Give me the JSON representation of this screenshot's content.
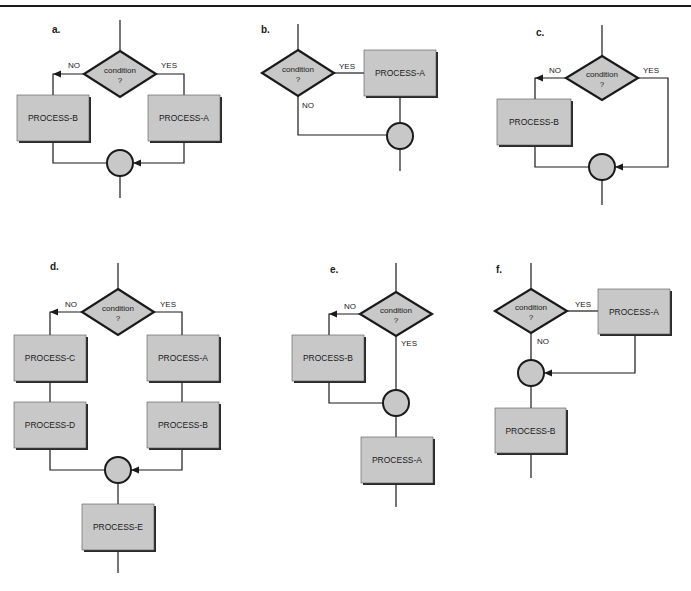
{
  "colors": {
    "fill": "#c8c8c8",
    "stroke": "#1a1a1a",
    "shadow": "#2a2a2a",
    "background": "#ffffff"
  },
  "labels": {
    "condition_line1": "condition",
    "condition_line2": "?",
    "yes": "YES",
    "no": "NO"
  },
  "panels": [
    {
      "id": "a",
      "label": "a.",
      "label_pos": [
        52,
        33
      ],
      "decision": {
        "cx": 120,
        "cy": 74,
        "hw": 36,
        "hh": 23
      },
      "boxes": [
        {
          "text": "PROCESS-B",
          "x": 17,
          "y": 95,
          "w": 72,
          "h": 46
        },
        {
          "text": "PROCESS-A",
          "x": 148,
          "y": 95,
          "w": 72,
          "h": 46
        }
      ],
      "junctions": [
        {
          "cx": 120,
          "cy": 163,
          "r": 13
        }
      ],
      "lines": [
        [
          [
            120,
            20
          ],
          [
            120,
            51
          ]
        ],
        [
          [
            84,
            74
          ],
          [
            53,
            74
          ],
          [
            53,
            95
          ]
        ],
        [
          [
            156,
            74
          ],
          [
            184,
            74
          ],
          [
            184,
            95
          ]
        ],
        [
          [
            53,
            141
          ],
          [
            53,
            163
          ],
          [
            107,
            163
          ]
        ],
        [
          [
            184,
            141
          ],
          [
            184,
            163
          ],
          [
            133,
            163
          ]
        ],
        [
          [
            120,
            176
          ],
          [
            120,
            198
          ]
        ]
      ],
      "arrows": [
        {
          "x": 53,
          "y": 74,
          "dir": "left"
        },
        {
          "x": 133,
          "y": 163,
          "dir": "left"
        }
      ],
      "texts": [
        {
          "key": "no",
          "x": 68,
          "y": 68
        },
        {
          "key": "yes",
          "x": 161,
          "y": 68
        }
      ]
    },
    {
      "id": "b",
      "label": "b.",
      "label_pos": [
        261,
        33
      ],
      "decision": {
        "cx": 298,
        "cy": 73,
        "hw": 36,
        "hh": 23
      },
      "boxes": [
        {
          "text": "PROCESS-A",
          "x": 364,
          "y": 50,
          "w": 72,
          "h": 46
        }
      ],
      "junctions": [
        {
          "cx": 400,
          "cy": 136,
          "r": 13
        }
      ],
      "lines": [
        [
          [
            298,
            24
          ],
          [
            298,
            50
          ]
        ],
        [
          [
            334,
            73
          ],
          [
            364,
            73
          ]
        ],
        [
          [
            298,
            96
          ],
          [
            298,
            135
          ],
          [
            387,
            135
          ]
        ],
        [
          [
            400,
            96
          ],
          [
            400,
            123
          ]
        ],
        [
          [
            400,
            149
          ],
          [
            400,
            171
          ]
        ]
      ],
      "arrows": [],
      "texts": [
        {
          "key": "yes",
          "x": 339,
          "y": 69
        },
        {
          "key": "no",
          "x": 302,
          "y": 108
        }
      ]
    },
    {
      "id": "c",
      "label": "c.",
      "label_pos": [
        536,
        36
      ],
      "decision": {
        "cx": 602,
        "cy": 78,
        "hw": 36,
        "hh": 22
      },
      "boxes": [
        {
          "text": "PROCESS-B",
          "x": 497,
          "y": 99,
          "w": 74,
          "h": 46
        }
      ],
      "junctions": [
        {
          "cx": 602,
          "cy": 167,
          "r": 13
        }
      ],
      "lines": [
        [
          [
            602,
            25
          ],
          [
            602,
            56
          ]
        ],
        [
          [
            566,
            78
          ],
          [
            535,
            78
          ],
          [
            535,
            99
          ]
        ],
        [
          [
            638,
            78
          ],
          [
            668,
            78
          ],
          [
            668,
            167
          ],
          [
            615,
            167
          ]
        ],
        [
          [
            535,
            145
          ],
          [
            535,
            167
          ],
          [
            589,
            167
          ]
        ],
        [
          [
            602,
            180
          ],
          [
            602,
            205
          ]
        ]
      ],
      "arrows": [
        {
          "x": 535,
          "y": 78,
          "dir": "left"
        },
        {
          "x": 615,
          "y": 167,
          "dir": "left"
        }
      ],
      "texts": [
        {
          "key": "no",
          "x": 549,
          "y": 73
        },
        {
          "key": "yes",
          "x": 643,
          "y": 73
        }
      ]
    },
    {
      "id": "d",
      "label": "d.",
      "label_pos": [
        50,
        270
      ],
      "decision": {
        "cx": 118,
        "cy": 312,
        "hw": 36,
        "hh": 23
      },
      "boxes": [
        {
          "text": "PROCESS-C",
          "x": 14,
          "y": 335,
          "w": 72,
          "h": 46
        },
        {
          "text": "PROCESS-A",
          "x": 147,
          "y": 335,
          "w": 72,
          "h": 46
        },
        {
          "text": "PROCESS-D",
          "x": 14,
          "y": 402,
          "w": 72,
          "h": 46
        },
        {
          "text": "PROCESS-B",
          "x": 147,
          "y": 402,
          "w": 72,
          "h": 46
        },
        {
          "text": "PROCESS-E",
          "x": 82,
          "y": 504,
          "w": 72,
          "h": 46
        }
      ],
      "junctions": [
        {
          "cx": 118,
          "cy": 470,
          "r": 13
        }
      ],
      "lines": [
        [
          [
            118,
            263
          ],
          [
            118,
            289
          ]
        ],
        [
          [
            82,
            312
          ],
          [
            50,
            312
          ],
          [
            50,
            335
          ]
        ],
        [
          [
            154,
            312
          ],
          [
            182,
            312
          ],
          [
            182,
            335
          ]
        ],
        [
          [
            50,
            381
          ],
          [
            50,
            402
          ]
        ],
        [
          [
            182,
            381
          ],
          [
            182,
            402
          ]
        ],
        [
          [
            50,
            448
          ],
          [
            50,
            470
          ],
          [
            105,
            470
          ]
        ],
        [
          [
            182,
            448
          ],
          [
            182,
            470
          ],
          [
            131,
            470
          ]
        ],
        [
          [
            118,
            483
          ],
          [
            118,
            504
          ]
        ],
        [
          [
            118,
            550
          ],
          [
            118,
            573
          ]
        ]
      ],
      "arrows": [
        {
          "x": 50,
          "y": 312,
          "dir": "left"
        },
        {
          "x": 131,
          "y": 470,
          "dir": "left"
        }
      ],
      "texts": [
        {
          "key": "no",
          "x": 65,
          "y": 307
        },
        {
          "key": "yes",
          "x": 160,
          "y": 307
        }
      ]
    },
    {
      "id": "e",
      "label": "e.",
      "label_pos": [
        330,
        273
      ],
      "decision": {
        "cx": 396,
        "cy": 314,
        "hw": 36,
        "hh": 22
      },
      "boxes": [
        {
          "text": "PROCESS-B",
          "x": 292,
          "y": 335,
          "w": 72,
          "h": 46
        },
        {
          "text": "PROCESS-A",
          "x": 361,
          "y": 437,
          "w": 72,
          "h": 46
        }
      ],
      "junctions": [
        {
          "cx": 396,
          "cy": 403,
          "r": 13
        }
      ],
      "lines": [
        [
          [
            396,
            263
          ],
          [
            396,
            292
          ]
        ],
        [
          [
            360,
            314
          ],
          [
            329,
            314
          ],
          [
            329,
            335
          ]
        ],
        [
          [
            396,
            336
          ],
          [
            396,
            390
          ]
        ],
        [
          [
            329,
            381
          ],
          [
            329,
            403
          ],
          [
            383,
            403
          ]
        ],
        [
          [
            396,
            416
          ],
          [
            396,
            437
          ]
        ],
        [
          [
            396,
            483
          ],
          [
            396,
            507
          ]
        ]
      ],
      "arrows": [
        {
          "x": 329,
          "y": 314,
          "dir": "left"
        }
      ],
      "texts": [
        {
          "key": "no",
          "x": 344,
          "y": 309
        },
        {
          "key": "yes",
          "x": 401,
          "y": 346
        }
      ]
    },
    {
      "id": "f",
      "label": "f.",
      "label_pos": [
        496,
        273
      ],
      "decision": {
        "cx": 531,
        "cy": 311,
        "hw": 36,
        "hh": 22
      },
      "boxes": [
        {
          "text": "PROCESS-A",
          "x": 598,
          "y": 289,
          "w": 72,
          "h": 45
        },
        {
          "text": "PROCESS-B",
          "x": 495,
          "y": 408,
          "w": 71,
          "h": 45
        }
      ],
      "junctions": [
        {
          "cx": 531,
          "cy": 373,
          "r": 13
        }
      ],
      "lines": [
        [
          [
            531,
            263
          ],
          [
            531,
            289
          ]
        ],
        [
          [
            567,
            311
          ],
          [
            598,
            311
          ]
        ],
        [
          [
            531,
            333
          ],
          [
            531,
            360
          ]
        ],
        [
          [
            635,
            334
          ],
          [
            635,
            373
          ],
          [
            544,
            373
          ]
        ],
        [
          [
            531,
            386
          ],
          [
            531,
            408
          ]
        ],
        [
          [
            531,
            453
          ],
          [
            531,
            478
          ]
        ]
      ],
      "arrows": [
        {
          "x": 544,
          "y": 373,
          "dir": "left"
        }
      ],
      "texts": [
        {
          "key": "yes",
          "x": 575,
          "y": 307
        },
        {
          "key": "no",
          "x": 537,
          "y": 344
        }
      ]
    }
  ]
}
